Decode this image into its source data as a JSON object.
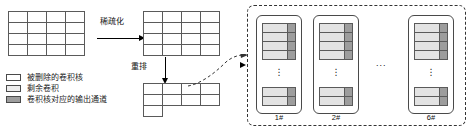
{
  "figure": {
    "type": "diagram"
  },
  "arrows": {
    "sparsify": {
      "label": "稀疏化",
      "direction": "right"
    },
    "rearrange": {
      "label": "重排",
      "direction": "down"
    },
    "to_groups": {
      "label": "",
      "direction": "curve-right",
      "style": "dashed"
    }
  },
  "matrices": {
    "original": {
      "name": "original-kernel-matrix",
      "rows": 4,
      "cols": 4,
      "fill": "white"
    },
    "sparsified": {
      "name": "sparsified-kernel-matrix",
      "rows": 4,
      "cols": 4,
      "fill": "white"
    },
    "rearranged": {
      "name": "rearranged-kernel-matrix",
      "row_lengths": [
        4,
        4,
        1
      ],
      "fill": "white"
    }
  },
  "legend": {
    "items": [
      {
        "swatch": "white",
        "label": "被删除的卷积核"
      },
      {
        "swatch": "light",
        "label": "剩余卷积"
      },
      {
        "swatch": "dark",
        "label": "卷积核对应的输出通道"
      }
    ]
  },
  "groups": {
    "ellipsis_between": "...",
    "items": [
      {
        "label": "1#",
        "top_rows": 4,
        "bottom_rows": 2,
        "vdots": "⋮"
      },
      {
        "label": "2#",
        "top_rows": 4,
        "bottom_rows": 2,
        "vdots": "⋮"
      },
      {
        "label": "6#",
        "top_rows": 4,
        "bottom_rows": 2,
        "vdots": "⋮"
      }
    ]
  },
  "colors": {
    "kernel_remaining": "#e3e3e3",
    "output_channel": "#9d9d9d",
    "deleted_kernel": "#ffffff",
    "stroke": "#5a5a5a",
    "dashed_border": "#333333"
  }
}
